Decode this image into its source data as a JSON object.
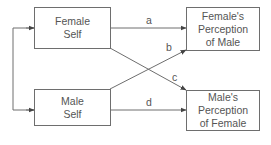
{
  "diagram": {
    "nodes": {
      "female_self": {
        "line1": "Female",
        "line2": "Self"
      },
      "male_self": {
        "line1": "Male",
        "line2": "Self"
      },
      "female_perception_of_male": {
        "line1": "Female's",
        "line2": "Perception",
        "line3": "of Male"
      },
      "male_perception_of_female": {
        "line1": "Male's",
        "line2": "Perception",
        "line3": "of Female"
      }
    },
    "edges": [
      {
        "id": "a",
        "label": "a",
        "from": "Female Self",
        "to": "Female's Perception of Male"
      },
      {
        "id": "b",
        "label": "b",
        "from": "Male Self",
        "to": "Female's Perception of Male"
      },
      {
        "id": "c",
        "label": "c",
        "from": "Female Self",
        "to": "Male's Perception of Female"
      },
      {
        "id": "d",
        "label": "d",
        "from": "Male Self",
        "to": "Male's Perception of Female"
      }
    ],
    "bracket": {
      "connects": [
        "Female Self",
        "Male Self"
      ],
      "bidirectional": true
    },
    "colors": {
      "line": "#6e6e6e",
      "text": "#555555",
      "background": "#ffffff"
    }
  }
}
